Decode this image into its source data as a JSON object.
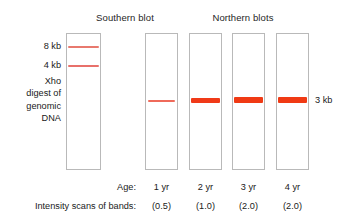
{
  "figure": {
    "titles": {
      "southern": "Southern blot",
      "northern": "Northern blots"
    },
    "southern_lane": {
      "left_labels": {
        "size_8kb": "8 kb",
        "size_4kb": "4 kb",
        "desc_line1": "Xho",
        "desc_line2": "digest of",
        "desc_line3": "genomic",
        "desc_line4": "DNA"
      },
      "bands": [
        {
          "label": "8 kb",
          "intensity": "faint"
        },
        {
          "label": "4 kb",
          "intensity": "faint"
        }
      ]
    },
    "northern_lanes": {
      "band_size_label": "3 kb",
      "lanes": [
        {
          "age": "1 yr",
          "intensity": "(0.5)"
        },
        {
          "age": "2 yr",
          "intensity": "(1.0)"
        },
        {
          "age": "3 yr",
          "intensity": "(2.0)"
        },
        {
          "age": "4 yr",
          "intensity": "(2.0)"
        }
      ]
    },
    "rows": {
      "age_label": "Age:",
      "intensity_label": "Intensity scans of bands:"
    },
    "colors": {
      "band_strong": "#f03a14",
      "band_faint": "#e8796e",
      "lane_border": "#b9b9b9",
      "text": "#1a1a1a",
      "background": "#ffffff"
    }
  },
  "chart_data": {
    "type": "bar",
    "categories": [
      "1 yr",
      "2 yr",
      "3 yr",
      "4 yr"
    ],
    "values": [
      0.5,
      1.0,
      2.0,
      2.0
    ],
    "xlabel": "Age",
    "ylabel": "Intensity scans of bands",
    "ylim": [
      0,
      2.0
    ],
    "annotations": [
      "3 kb transcript",
      "Southern blot shows 8 kb and 4 kb Xho digest bands"
    ]
  }
}
